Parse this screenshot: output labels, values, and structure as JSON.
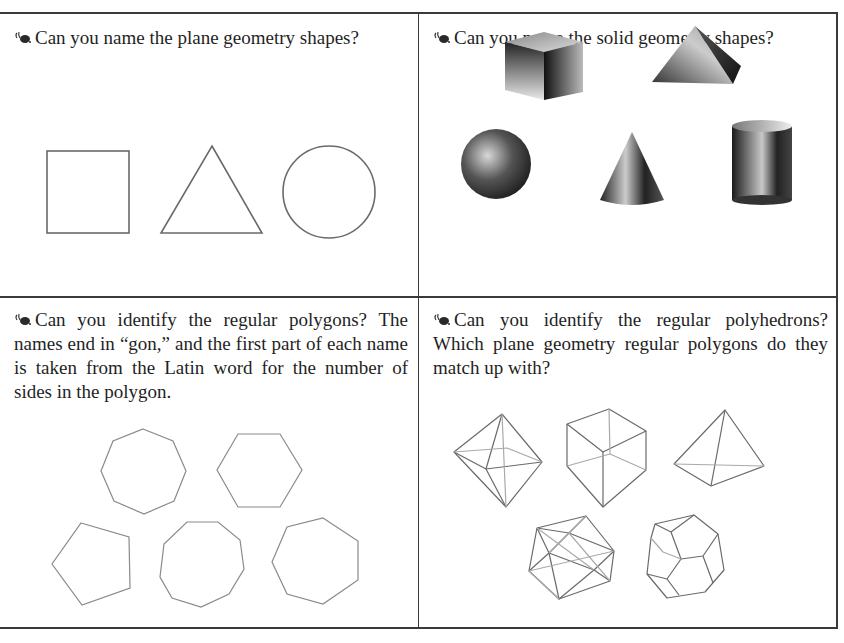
{
  "panels": [
    {
      "id": "plane-shapes",
      "question": "Can you name the plane geometry shapes?",
      "figures": [
        "square",
        "triangle",
        "circle"
      ]
    },
    {
      "id": "solid-shapes",
      "question": "Can you name the solid geometry shapes?",
      "figures": [
        "cube",
        "pyramid",
        "sphere",
        "cone",
        "cylinder"
      ]
    },
    {
      "id": "regular-polygons",
      "question": "Can you identify the regular polygons? The names end in “gon,” and the first part of each name is taken from the Latin word for the number of sides in the polygon.",
      "figures": [
        "octagon",
        "hexagon",
        "pentagon",
        "nonagon",
        "heptagon"
      ]
    },
    {
      "id": "regular-polyhedrons",
      "question": "Can you identify the regular polyhedrons? Which plane geometry regular polygons do they match up with?",
      "figures": [
        "octahedron",
        "cube",
        "tetrahedron",
        "icosahedron",
        "dodecahedron"
      ]
    }
  ],
  "colors": {
    "border": "#3a3a3a",
    "line": "#6a6a6a",
    "text": "#1f1f1f"
  }
}
